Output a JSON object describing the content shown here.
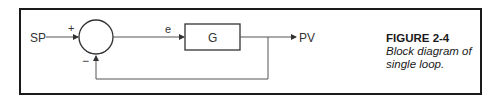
{
  "diagram": {
    "type": "block-diagram",
    "input_label": "SP",
    "plus_sign": "+",
    "minus_sign": "−",
    "error_label": "e",
    "block_label": "G",
    "output_label": "PV"
  },
  "caption": {
    "title": "FIGURE 2-4",
    "text": "Block diagram of single loop."
  }
}
